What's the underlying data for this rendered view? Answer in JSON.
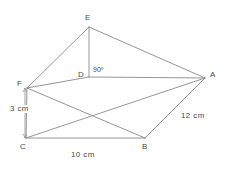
{
  "figure": {
    "type": "geometry-diagram",
    "shape": "triangular-prism-solid",
    "background_color": "#ffffff",
    "stroke_color": "#8a8a8a",
    "text_color": "#4a4a4a",
    "vertices": [
      {
        "id": "E",
        "label": "E",
        "x": 89,
        "y": 27,
        "label_x": 85,
        "label_y": 14
      },
      {
        "id": "D",
        "label": "D",
        "x": 89,
        "y": 77,
        "label_x": 78,
        "label_y": 71
      },
      {
        "id": "A",
        "label": "A",
        "x": 205,
        "y": 78,
        "label_x": 210,
        "label_y": 71
      },
      {
        "id": "F",
        "label": "F",
        "x": 27,
        "y": 88,
        "label_x": 17,
        "label_y": 80
      },
      {
        "id": "C",
        "label": "C",
        "x": 26,
        "y": 138,
        "label_x": 20,
        "label_y": 143
      },
      {
        "id": "B",
        "label": "B",
        "x": 145,
        "y": 138,
        "label_x": 142,
        "label_y": 143
      }
    ],
    "edges": [
      {
        "from": "E",
        "to": "F"
      },
      {
        "from": "E",
        "to": "D"
      },
      {
        "from": "E",
        "to": "A"
      },
      {
        "from": "F",
        "to": "D"
      },
      {
        "from": "D",
        "to": "A"
      },
      {
        "from": "F",
        "to": "B"
      },
      {
        "from": "C",
        "to": "A"
      },
      {
        "from": "C",
        "to": "B"
      },
      {
        "from": "B",
        "to": "A"
      },
      {
        "from": "F",
        "to": "C"
      }
    ],
    "angle_markers": [
      {
        "id": "angle-D",
        "label": "90º",
        "x": 93,
        "y": 66
      }
    ],
    "dimensions": [
      {
        "id": "dim-cf",
        "label": "3 cm",
        "orientation": "vertical",
        "line_x": 25,
        "line_y1": 88,
        "line_y2": 138,
        "label_x": 9,
        "label_y": 105
      },
      {
        "id": "dim-cb",
        "label": "10 cm",
        "orientation": "horizontal",
        "label_x": 71,
        "label_y": 151
      },
      {
        "id": "dim-ab",
        "label": "12 cm",
        "orientation": "diagonal",
        "label_x": 181,
        "label_y": 112
      }
    ]
  }
}
